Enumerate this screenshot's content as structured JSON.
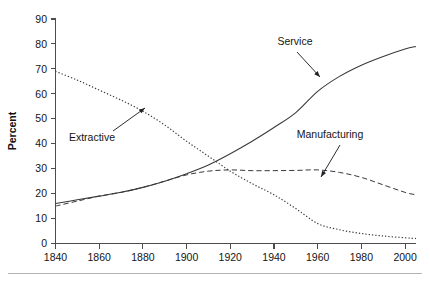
{
  "figure": {
    "background_color": "#ffffff",
    "ink_color": "#38383c",
    "text_color": "#141414",
    "axis_color": "#4d4d4d",
    "footer_rule_color": "#b3b3b3"
  },
  "axis_titles": {
    "y": "Percent",
    "x": ""
  },
  "annotations": [
    {
      "name": "extractive",
      "label": "Extractive",
      "text_x": 92,
      "text_y": 141,
      "arrow_from_x": 113,
      "arrow_from_y": 131,
      "arrow_to_x": 145,
      "arrow_to_y": 108
    },
    {
      "name": "service",
      "label": "Service",
      "text_x": 295,
      "text_y": 45,
      "arrow_from_x": 297,
      "arrow_from_y": 52,
      "arrow_to_x": 320,
      "arrow_to_y": 77
    },
    {
      "name": "manufacturing",
      "label": "Manufacturing",
      "text_x": 330,
      "text_y": 138,
      "arrow_from_x": 340,
      "arrow_from_y": 145,
      "arrow_to_x": 321,
      "arrow_to_y": 177
    }
  ],
  "chart_data": {
    "type": "line",
    "title": "",
    "subtitle": "",
    "xlabel": "",
    "ylabel": "Percent",
    "xlim": [
      1840,
      2005
    ],
    "ylim": [
      0,
      90
    ],
    "grid": false,
    "legend": "none",
    "legend_position": "inline-annotations",
    "x_ticks": [
      1840,
      1860,
      1880,
      1900,
      1920,
      1940,
      1960,
      1980,
      2000
    ],
    "x_tick_labels": [
      "1840",
      "1860",
      "1880",
      "1900",
      "1920",
      "1940",
      "1960",
      "1980",
      "2000"
    ],
    "y_ticks": [
      0,
      10,
      20,
      30,
      40,
      50,
      60,
      70,
      80,
      90
    ],
    "y_tick_labels": [
      "0",
      "10",
      "20",
      "30",
      "40",
      "50",
      "60",
      "70",
      "80",
      "90"
    ],
    "x": [
      1840,
      1850,
      1860,
      1870,
      1880,
      1890,
      1900,
      1910,
      1920,
      1930,
      1940,
      1950,
      1960,
      1970,
      1980,
      1990,
      2000,
      2005
    ],
    "series": [
      {
        "name": "Extractive",
        "style": "dotted",
        "values": [
          69,
          65.5,
          61.5,
          57.5,
          53,
          47.5,
          41,
          35,
          29,
          24,
          19.5,
          14,
          8,
          5.5,
          4,
          3,
          2.3,
          2
        ]
      },
      {
        "name": "Service",
        "style": "solid",
        "values": [
          16,
          17.5,
          19,
          20.5,
          22.5,
          25,
          28,
          31.5,
          36,
          41,
          46.5,
          52.5,
          61,
          67,
          71.5,
          75,
          78,
          79
        ]
      },
      {
        "name": "Manufacturing",
        "style": "dashed",
        "values": [
          15,
          17,
          19,
          20.5,
          22.5,
          25,
          27.5,
          29,
          29.5,
          29.2,
          29.2,
          29.3,
          29.5,
          28.5,
          26.5,
          23.5,
          20.5,
          19.5
        ]
      }
    ]
  }
}
